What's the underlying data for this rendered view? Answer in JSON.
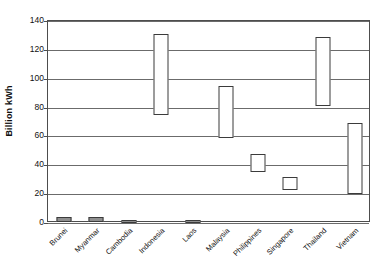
{
  "chart_data": {
    "type": "bar",
    "subtype": "floating-range-bar",
    "title": "",
    "subtitle": "",
    "xlabel": "",
    "ylabel": "Billion kWh",
    "ylim": [
      0,
      140
    ],
    "ytick_step": 20,
    "yticks": [
      0,
      20,
      40,
      60,
      80,
      100,
      120,
      140
    ],
    "ytick_labels": [
      "0",
      "20",
      "40",
      "60",
      "80",
      "100",
      "120",
      "140"
    ],
    "grid": true,
    "legend": false,
    "legend_position": "none",
    "xtick_rotation": -45,
    "categories": [
      "Brunei",
      "Myanmar",
      "Cambodia",
      "Indonesia",
      "Laos",
      "Malaysia",
      "Philippines",
      "Singapore",
      "Thailand",
      "Vietnam"
    ],
    "series": [
      {
        "name": "Low",
        "values": [
          1,
          1,
          0.5,
          75,
          0.5,
          59,
          35,
          23,
          81,
          20
        ]
      },
      {
        "name": "High",
        "values": [
          4,
          4,
          2,
          131,
          2,
          95,
          48,
          32,
          129,
          69
        ]
      }
    ],
    "bars": [
      {
        "category": "Brunei",
        "low": 1,
        "high": 4
      },
      {
        "category": "Myanmar",
        "low": 1,
        "high": 4
      },
      {
        "category": "Cambodia",
        "low": 0.5,
        "high": 2
      },
      {
        "category": "Indonesia",
        "low": 75,
        "high": 131
      },
      {
        "category": "Laos",
        "low": 0.5,
        "high": 2
      },
      {
        "category": "Malaysia",
        "low": 59,
        "high": 95
      },
      {
        "category": "Philippines",
        "low": 35,
        "high": 48
      },
      {
        "category": "Singapore",
        "low": 23,
        "high": 32
      },
      {
        "category": "Thailand",
        "low": 81,
        "high": 129
      },
      {
        "category": "Vietnam",
        "low": 20,
        "high": 69
      }
    ],
    "colors": {
      "bar_fill": "#ffffff",
      "bar_stroke": "#3b3b3b",
      "tiny_bar_fill": "#8f8f8f",
      "gridline": "#6b6b6b",
      "axis": "#4d4d4d",
      "background": "#ffffff",
      "text": "#111111"
    }
  }
}
